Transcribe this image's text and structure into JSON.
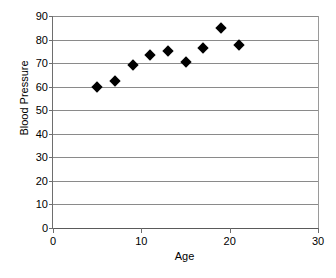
{
  "chart_data": {
    "type": "scatter",
    "title": "",
    "xlabel": "Age",
    "ylabel": "Blood Pressure",
    "xlim": [
      0,
      30
    ],
    "ylim": [
      0,
      90
    ],
    "xticks": [
      0,
      10,
      20,
      30
    ],
    "yticks": [
      0,
      10,
      20,
      30,
      40,
      50,
      60,
      70,
      80,
      90
    ],
    "xtick_labels": [
      "0",
      "10",
      "20",
      "30"
    ],
    "ytick_labels": [
      "0",
      "10",
      "20",
      "30",
      "40",
      "50",
      "60",
      "70",
      "80",
      "90"
    ],
    "grid": "horizontal",
    "legend": "none",
    "marker": "diamond",
    "marker_color": "#000000",
    "x": [
      5,
      7,
      9,
      11,
      13,
      15,
      17,
      19,
      21
    ],
    "y": [
      60,
      62.5,
      69,
      73.5,
      75,
      70.5,
      76.5,
      85,
      77.5
    ],
    "points": [
      {
        "x": 5,
        "y": 60
      },
      {
        "x": 7,
        "y": 62.5
      },
      {
        "x": 9,
        "y": 69
      },
      {
        "x": 11,
        "y": 73.5
      },
      {
        "x": 13,
        "y": 75
      },
      {
        "x": 15,
        "y": 70.5
      },
      {
        "x": 17,
        "y": 76.5
      },
      {
        "x": 19,
        "y": 85
      },
      {
        "x": 21,
        "y": 77.5
      }
    ]
  },
  "colors": {
    "gridline": "#8a8a8a",
    "axis": "#5a5a5a",
    "marker": "#000000",
    "background": "#ffffff"
  }
}
